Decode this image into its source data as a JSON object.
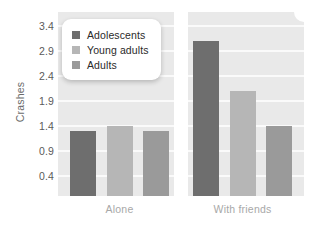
{
  "chart_data": {
    "type": "bar",
    "title": "",
    "xlabel": "",
    "ylabel": "Crashes",
    "categories": [
      "Alone",
      "With friends"
    ],
    "series": [
      {
        "name": "Adolescents",
        "color": "#6e6e6e",
        "values": [
          1.3,
          3.1
        ]
      },
      {
        "name": "Young adults",
        "color": "#b6b6b6",
        "values": [
          1.4,
          2.1
        ]
      },
      {
        "name": "Adults",
        "color": "#9a9a9a",
        "values": [
          1.3,
          1.4
        ]
      }
    ],
    "yticks": [
      "0.4",
      "0.9",
      "1.4",
      "1.9",
      "2.4",
      "2.9",
      "3.4"
    ],
    "ytick_values": [
      0.4,
      0.9,
      1.4,
      1.9,
      2.4,
      2.9,
      3.4
    ],
    "ylim": [
      0.0,
      3.68
    ],
    "grid": "horizontal",
    "legend_position": "top-left",
    "panel_color": "#e9e9e9",
    "gridline_color": "#fafafa"
  }
}
